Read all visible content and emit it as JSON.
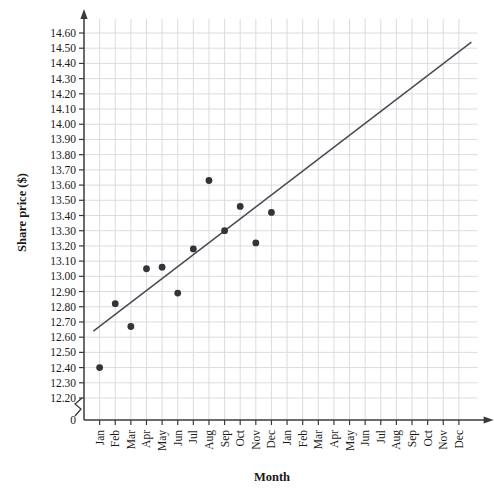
{
  "chart_data": {
    "type": "scatter",
    "title": "",
    "xlabel": "Month",
    "ylabel": "Share price ($)",
    "grid": true,
    "legend": "none",
    "axis_break": true,
    "zero_label": "0",
    "ylim": [
      12.2,
      14.6
    ],
    "ystep": 0.1,
    "ytick_labels": [
      "14.60",
      "14.50",
      "14.40",
      "14.30",
      "14.20",
      "14.10",
      "14.00",
      "13.90",
      "13.80",
      "13.70",
      "13.60",
      "13.50",
      "13.40",
      "13.30",
      "13.20",
      "13.10",
      "13.00",
      "12.90",
      "12.80",
      "12.70",
      "12.60",
      "12.50",
      "12.40",
      "12.30",
      "12.20"
    ],
    "ytick_values": [
      14.6,
      14.5,
      14.4,
      14.3,
      14.2,
      14.1,
      14.0,
      13.9,
      13.8,
      13.7,
      13.6,
      13.5,
      13.4,
      13.3,
      13.2,
      13.1,
      13.0,
      12.9,
      12.8,
      12.7,
      12.6,
      12.5,
      12.4,
      12.3,
      12.2
    ],
    "categories": [
      "Jan",
      "Feb",
      "Mar",
      "Apr",
      "May",
      "Jun",
      "Jul",
      "Aug",
      "Sep",
      "Oct",
      "Nov",
      "Dec",
      "Jan",
      "Feb",
      "Mar",
      "Apr",
      "May",
      "Jun",
      "Jul",
      "Aug",
      "Sep",
      "Oct",
      "Nov",
      "Dec"
    ],
    "points": [
      {
        "x": 1,
        "label": "Jan",
        "y": 12.4
      },
      {
        "x": 2,
        "label": "Feb",
        "y": 12.82
      },
      {
        "x": 3,
        "label": "Mar",
        "y": 12.67
      },
      {
        "x": 4,
        "label": "Apr",
        "y": 13.05
      },
      {
        "x": 5,
        "label": "May",
        "y": 13.06
      },
      {
        "x": 6,
        "label": "Jun",
        "y": 12.89
      },
      {
        "x": 7,
        "label": "Jul",
        "y": 13.18
      },
      {
        "x": 8,
        "label": "Aug",
        "y": 13.63
      },
      {
        "x": 9,
        "label": "Sep",
        "y": 13.3
      },
      {
        "x": 10,
        "label": "Oct",
        "y": 13.46
      },
      {
        "x": 11,
        "label": "Nov",
        "y": 13.22
      },
      {
        "x": 12,
        "label": "Dec",
        "y": 13.42
      }
    ],
    "trend_line": {
      "x_start": 0.6,
      "y_start": 12.64,
      "x_end": 24.8,
      "y_end": 14.54
    }
  }
}
